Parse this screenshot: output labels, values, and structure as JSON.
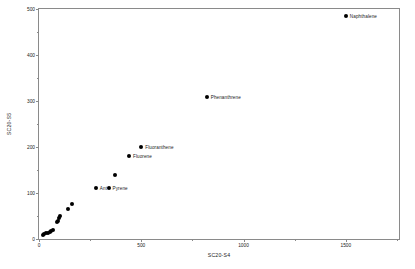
{
  "chart_data": {
    "type": "scatter",
    "title": "",
    "xlabel": "SC20-S4",
    "ylabel": "SC20-S5",
    "xlim": [
      0,
      1760
    ],
    "ylim": [
      0,
      500
    ],
    "grid": false,
    "legend": "none",
    "xticks": [
      0,
      500,
      1000,
      1500
    ],
    "xticklabels": [
      "0",
      "500",
      "1000",
      "1500"
    ],
    "xminorticks": [
      250,
      750,
      1250,
      1750
    ],
    "yticks": [
      0,
      100,
      200,
      300,
      400,
      500
    ],
    "yticklabels": [
      "0",
      "100",
      "200",
      "300",
      "400",
      "500"
    ],
    "yminorticks": [
      50,
      150,
      250,
      350,
      450
    ],
    "marker": "filled-circle",
    "marker_color": "#000000",
    "points": [
      {
        "x": 1500,
        "y": 485,
        "label": "Naphthalene",
        "label_dx": 4,
        "label_dy": 0
      },
      {
        "x": 820,
        "y": 308,
        "label": "Phenanthrene",
        "label_dx": 4,
        "label_dy": 0
      },
      {
        "x": 500,
        "y": 200,
        "label": "Fluoranthene",
        "label_dx": 4,
        "label_dy": 0
      },
      {
        "x": 440,
        "y": 180,
        "label": "Fluorene",
        "label_dx": 4,
        "label_dy": 0
      },
      {
        "x": 340,
        "y": 110,
        "label": "Pyrene",
        "label_dx": 4,
        "label_dy": 0
      },
      {
        "x": 278,
        "y": 110,
        "label": "Ant",
        "label_dx": 4,
        "label_dy": 0
      },
      {
        "x": 370,
        "y": 140,
        "label": "",
        "label_dx": 0,
        "label_dy": 0
      },
      {
        "x": 163,
        "y": 76,
        "label": "",
        "label_dx": 0,
        "label_dy": 0
      },
      {
        "x": 140,
        "y": 66,
        "label": "",
        "label_dx": 0,
        "label_dy": 0
      },
      {
        "x": 103,
        "y": 50,
        "label": "",
        "label_dx": 0,
        "label_dy": 0
      },
      {
        "x": 98,
        "y": 46,
        "label": "",
        "label_dx": 0,
        "label_dy": 0
      },
      {
        "x": 92,
        "y": 40,
        "label": "",
        "label_dx": 0,
        "label_dy": 0
      },
      {
        "x": 86,
        "y": 36,
        "label": "",
        "label_dx": 0,
        "label_dy": 0
      },
      {
        "x": 66,
        "y": 20,
        "label": "",
        "label_dx": 0,
        "label_dy": 0
      },
      {
        "x": 60,
        "y": 18,
        "label": "",
        "label_dx": 0,
        "label_dy": 0
      },
      {
        "x": 52,
        "y": 16,
        "label": "",
        "label_dx": 0,
        "label_dy": 0
      },
      {
        "x": 42,
        "y": 14,
        "label": "",
        "label_dx": 0,
        "label_dy": 0
      },
      {
        "x": 34,
        "y": 12,
        "label": "",
        "label_dx": 0,
        "label_dy": 0
      },
      {
        "x": 26,
        "y": 10,
        "label": "",
        "label_dx": 0,
        "label_dy": 0
      },
      {
        "x": 20,
        "y": 9,
        "label": "",
        "label_dx": 0,
        "label_dy": 0
      }
    ]
  }
}
